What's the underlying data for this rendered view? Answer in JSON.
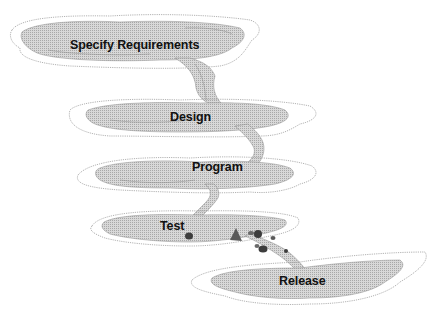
{
  "diagram": {
    "type": "waterfall-process",
    "stages": [
      {
        "label": "Specify Requirements"
      },
      {
        "label": "Design"
      },
      {
        "label": "Program"
      },
      {
        "label": "Test"
      },
      {
        "label": "Release"
      }
    ],
    "colors": {
      "pool_fill": "#cfcfcf",
      "pool_outline": "#9a9a9a",
      "stream": "#bdbdbd",
      "rocks": "#3d3d3d",
      "label": "#111111"
    }
  }
}
